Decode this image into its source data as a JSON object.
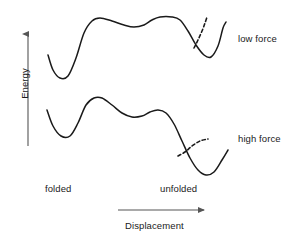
{
  "figure": {
    "background_color": "#ffffff",
    "curve_color": "#1a1a1a",
    "axis_color": "#555555",
    "text_color": "#1a1a1a"
  },
  "axes": {
    "y": {
      "label": "Energy",
      "arrow_direction": "up",
      "name": "energy-axis"
    },
    "x": {
      "label": "Displacement",
      "arrow_direction": "right",
      "name": "displacement-axis",
      "tick_labels": [
        "folded",
        "unfolded"
      ]
    }
  },
  "curves": [
    {
      "name": "low-force-curve",
      "label": "low force",
      "style": "solid",
      "description": "Energy landscape at low force: deep folded well on the left, high broad barrier across the middle with a shallow intermediate dip, and an unfolded well on the right that sits higher than the folded well.",
      "points": [
        [
          48,
          55
        ],
        [
          53,
          70
        ],
        [
          60,
          78
        ],
        [
          68,
          76
        ],
        [
          76,
          58
        ],
        [
          84,
          33
        ],
        [
          92,
          21
        ],
        [
          100,
          18
        ],
        [
          112,
          21
        ],
        [
          124,
          25
        ],
        [
          134,
          27
        ],
        [
          144,
          25
        ],
        [
          152,
          20
        ],
        [
          160,
          17
        ],
        [
          172,
          17
        ],
        [
          180,
          20
        ],
        [
          188,
          31
        ],
        [
          196,
          45
        ],
        [
          204,
          55
        ],
        [
          211,
          57
        ],
        [
          218,
          46
        ],
        [
          223,
          28
        ],
        [
          226,
          22
        ]
      ]
    },
    {
      "name": "low-force-dashed-branch",
      "label": "",
      "style": "dashed",
      "description": "Dashed branch rising steeply from the descending limb of the unfolded well, showing the tilted/alternate pathway at low force.",
      "points": [
        [
          194,
          48
        ],
        [
          198,
          40
        ],
        [
          202,
          31
        ],
        [
          205,
          23
        ],
        [
          207,
          17
        ]
      ]
    },
    {
      "name": "high-force-curve",
      "label": "high force",
      "style": "solid",
      "description": "Energy landscape at high force: the landscape is tilted so the barrier is lowered and the unfolded well on the right becomes deeper than the folded well on the left.",
      "points": [
        [
          47,
          110
        ],
        [
          53,
          126
        ],
        [
          61,
          136
        ],
        [
          70,
          136
        ],
        [
          78,
          123
        ],
        [
          86,
          105
        ],
        [
          94,
          98
        ],
        [
          102,
          98
        ],
        [
          112,
          105
        ],
        [
          122,
          113
        ],
        [
          132,
          117
        ],
        [
          142,
          116
        ],
        [
          150,
          112
        ],
        [
          158,
          110
        ],
        [
          166,
          113
        ],
        [
          174,
          124
        ],
        [
          182,
          141
        ],
        [
          190,
          158
        ],
        [
          198,
          170
        ],
        [
          206,
          175
        ],
        [
          214,
          172
        ],
        [
          222,
          160
        ],
        [
          228,
          150
        ]
      ]
    },
    {
      "name": "high-force-dashed-branch",
      "label": "",
      "style": "dashed",
      "description": "Dashed branch leaving the steep descending limb and curving gently upward to the right at high force.",
      "points": [
        [
          178,
          156
        ],
        [
          185,
          152
        ],
        [
          192,
          146
        ],
        [
          200,
          141
        ],
        [
          208,
          139
        ]
      ]
    }
  ],
  "labels": {
    "low_force": "low force",
    "high_force": "high force",
    "folded": "folded",
    "unfolded": "unfolded",
    "energy": "Energy",
    "displacement": "Displacement"
  }
}
